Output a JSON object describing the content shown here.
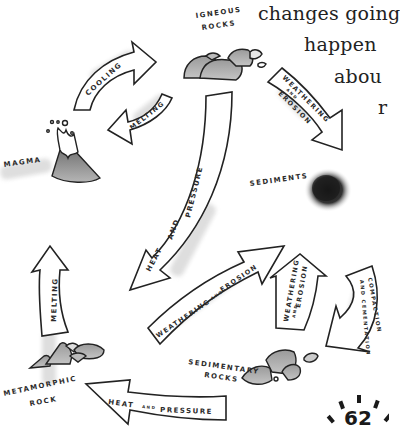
{
  "page": {
    "body_text_lines": [
      "changes going",
      "happen",
      "abou",
      "r"
    ],
    "page_number": "62"
  },
  "diagram": {
    "nodes": {
      "igneous": {
        "label_line1": "IGNEOUS",
        "label_line2": "ROCKS"
      },
      "magma": {
        "label": "MAGMA"
      },
      "sediments": {
        "label": "SEDIMENTS"
      },
      "sedimentary": {
        "label_line1": "SEDIMENTARY",
        "label_line2": "ROCKS"
      },
      "metamorphic": {
        "label_line1": "METAMORPHIC",
        "label_line2": "ROCK"
      }
    },
    "arrows": {
      "cooling": "COOLING",
      "melting_top": "MELTING",
      "weathering_erosion_top": {
        "line1": "WEATHERING",
        "line2": "AND",
        "line3": "EROSION"
      },
      "heat_pressure_center": {
        "w1": "HEAT",
        "w2": "AND",
        "w3": "PRESSURE"
      },
      "weathering_erosion_center": {
        "w1": "WEATHERING",
        "w2": "AND",
        "w3": "EROSION"
      },
      "weathering_erosion_right": {
        "line1": "WEATHERING",
        "line2": "AND",
        "line3": "EROSION"
      },
      "compaction_cementation": {
        "line1": "COMPACTION",
        "line2": "AND CEMENTATION"
      },
      "melting_left": "MELTING",
      "heat_pressure_bottom": {
        "w1": "HEAT",
        "w2": "AND",
        "w3": "PRESSURE"
      }
    }
  }
}
